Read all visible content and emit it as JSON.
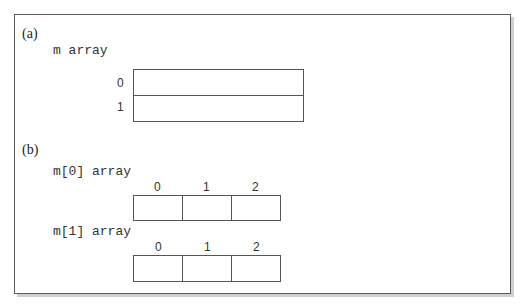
{
  "part_a": {
    "label": "(a)",
    "array_name": "m array",
    "rows": [
      {
        "index": "0",
        "value": ""
      },
      {
        "index": "1",
        "value": ""
      }
    ]
  },
  "part_b": {
    "label": "(b)",
    "arrays": [
      {
        "name": "m[0] array",
        "indices": [
          "0",
          "1",
          "2"
        ],
        "values": [
          "",
          "",
          ""
        ]
      },
      {
        "name": "m[1] array",
        "indices": [
          "0",
          "1",
          "2"
        ],
        "values": [
          "",
          "",
          ""
        ]
      }
    ]
  },
  "colors": {
    "border": "#555555",
    "frame": "#5a5a5a",
    "shadow": "#cfcfcf",
    "text": "#333333"
  }
}
